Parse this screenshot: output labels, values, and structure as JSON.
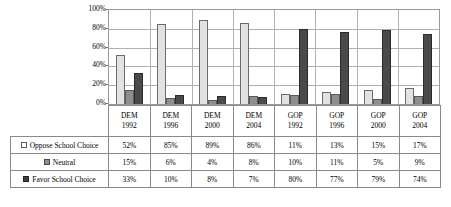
{
  "chart_data": {
    "type": "bar",
    "title": "",
    "xlabel": "",
    "ylabel": "",
    "ylim": [
      0,
      100
    ],
    "ytick_labels": [
      "100%",
      "80%",
      "60%",
      "40%",
      "20%",
      "0%"
    ],
    "ytick_values": [
      100,
      80,
      60,
      40,
      20,
      0
    ],
    "grid": true,
    "legend_position": "table-row-labels",
    "categories": [
      "DEM 1992",
      "DEM 1996",
      "DEM 2000",
      "DEM 2004",
      "GOP 1992",
      "GOP 1996",
      "GOP 2000",
      "GOP 2004"
    ],
    "category_parties": [
      "DEM",
      "DEM",
      "DEM",
      "DEM",
      "GOP",
      "GOP",
      "GOP",
      "GOP"
    ],
    "category_years": [
      "1992",
      "1996",
      "2000",
      "2004",
      "1992",
      "1996",
      "2000",
      "2004"
    ],
    "series": [
      {
        "name": "Oppose School Choice",
        "color": "#e2e2e2",
        "values": [
          52,
          85,
          89,
          86,
          11,
          13,
          15,
          17
        ],
        "labels": [
          "52%",
          "85%",
          "89%",
          "86%",
          "11%",
          "13%",
          "15%",
          "17%"
        ]
      },
      {
        "name": "Neutral",
        "color": "#8e8e8e",
        "values": [
          15,
          6,
          4,
          8,
          10,
          11,
          5,
          9
        ],
        "labels": [
          "15%",
          "6%",
          "4%",
          "8%",
          "10%",
          "11%",
          "5%",
          "9%"
        ]
      },
      {
        "name": "Favor School Choice",
        "color": "#4a4a4a",
        "values": [
          33,
          10,
          8,
          7,
          80,
          77,
          79,
          74
        ],
        "labels": [
          "33%",
          "10%",
          "8%",
          "7%",
          "80%",
          "77%",
          "79%",
          "74%"
        ]
      }
    ]
  }
}
